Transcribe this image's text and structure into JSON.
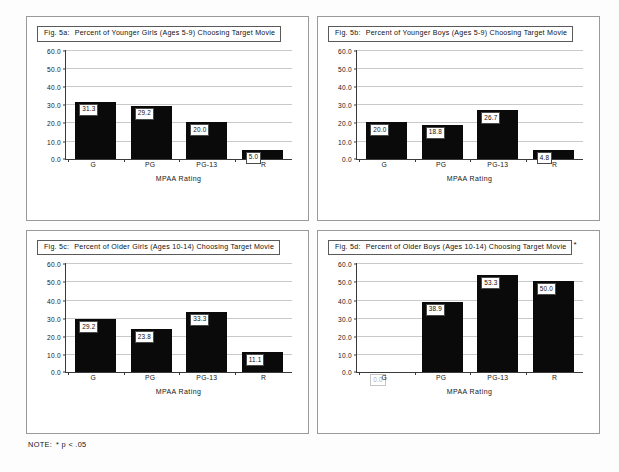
{
  "note": {
    "label": "NOTE:",
    "text": "* p < .05"
  },
  "axis": {
    "xlabel": "MPAA Rating",
    "categories": [
      "G",
      "PG",
      "PG-13",
      "R"
    ],
    "yticks": [
      "0.0",
      "10.0",
      "20.0",
      "30.0",
      "40.0",
      "50.0",
      "60.0"
    ],
    "ymin": 0,
    "ymax": 60
  },
  "panels": [
    {
      "fig_no": "Fig. 5a:",
      "title": "Percent of Younger Girls (Ages 5-9) Choosing Target Movie",
      "starred": false,
      "star": "",
      "values": [
        "31.3",
        "29.2",
        "20.0",
        "5.0"
      ]
    },
    {
      "fig_no": "Fig. 5b:",
      "title": "Percent of Younger Boys (Ages 5-9) Choosing Target Movie",
      "starred": false,
      "star": "",
      "values": [
        "20.0",
        "18.8",
        "26.7",
        "4.8"
      ]
    },
    {
      "fig_no": "Fig. 5c:",
      "title": "Percent of Older Girls (Ages 10-14) Choosing Target Movie",
      "starred": false,
      "star": "",
      "values": [
        "29.2",
        "23.8",
        "33.3",
        "11.1"
      ]
    },
    {
      "fig_no": "Fig. 5d:",
      "title": "Percent of Older Boys (Ages 10-14) Choosing Target Movie",
      "starred": true,
      "star": "*",
      "values": [
        "0.0",
        "38.9",
        "53.3",
        "50.0"
      ]
    }
  ],
  "chart_data": [
    {
      "type": "bar",
      "title": "Fig. 5a:  Percent of Younger Girls (Ages 5-9) Choosing Target Movie",
      "xlabel": "MPAA Rating",
      "ylabel": "",
      "categories": [
        "G",
        "PG",
        "PG-13",
        "R"
      ],
      "values": [
        31.3,
        29.2,
        20.0,
        5.0
      ],
      "ylim": [
        0,
        60
      ],
      "ytick_step": 10,
      "grid": true,
      "legend": "none"
    },
    {
      "type": "bar",
      "title": "Fig. 5b:  Percent of Younger Boys (Ages 5-9) Choosing Target Movie",
      "xlabel": "MPAA Rating",
      "ylabel": "",
      "categories": [
        "G",
        "PG",
        "PG-13",
        "R"
      ],
      "values": [
        20.0,
        18.8,
        26.7,
        4.8
      ],
      "ylim": [
        0,
        60
      ],
      "ytick_step": 10,
      "grid": true,
      "legend": "none"
    },
    {
      "type": "bar",
      "title": "Fig. 5c:  Percent of Older Girls (Ages 10-14) Choosing Target Movie",
      "xlabel": "MPAA Rating",
      "ylabel": "",
      "categories": [
        "G",
        "PG",
        "PG-13",
        "R"
      ],
      "values": [
        29.2,
        23.8,
        33.3,
        11.1
      ],
      "ylim": [
        0,
        60
      ],
      "ytick_step": 10,
      "grid": true,
      "legend": "none"
    },
    {
      "type": "bar",
      "title": "Fig. 5d:  Percent of Older Boys (Ages 10-14) Choosing Target Movie*",
      "xlabel": "MPAA Rating",
      "ylabel": "",
      "categories": [
        "G",
        "PG",
        "PG-13",
        "R"
      ],
      "values": [
        0.0,
        38.9,
        53.3,
        50.0
      ],
      "ylim": [
        0,
        60
      ],
      "ytick_step": 10,
      "grid": true,
      "legend": "none",
      "annotation": "* p < .05"
    }
  ]
}
